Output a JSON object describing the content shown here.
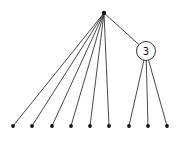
{
  "diagram": {
    "type": "tree",
    "root": {
      "id": "root",
      "x": 104,
      "y": 13
    },
    "cluster": {
      "id": "cluster",
      "label": "3",
      "x": 146,
      "y": 51,
      "r": 9.5
    },
    "leaves_from_root": [
      {
        "x": 13,
        "y": 126
      },
      {
        "x": 32,
        "y": 126
      },
      {
        "x": 52,
        "y": 126
      },
      {
        "x": 71,
        "y": 126
      },
      {
        "x": 90,
        "y": 126
      },
      {
        "x": 109,
        "y": 126
      }
    ],
    "leaves_from_cluster": [
      {
        "x": 129,
        "y": 126
      },
      {
        "x": 148,
        "y": 126
      },
      {
        "x": 167,
        "y": 126
      }
    ],
    "colors": {
      "edge": "#333333",
      "node": "#111111",
      "background": "#ffffff"
    }
  }
}
